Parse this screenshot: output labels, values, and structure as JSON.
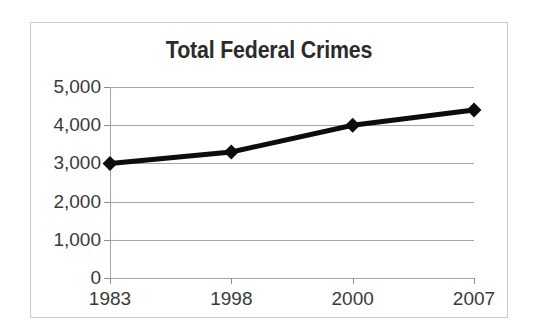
{
  "chart_data": {
    "type": "line",
    "title": "Total Federal Crimes",
    "xlabel": "",
    "ylabel": "",
    "categories": [
      "1983",
      "1998",
      "2000",
      "2007"
    ],
    "values": [
      3000,
      3300,
      4000,
      4400
    ],
    "series": [
      {
        "name": "Total Federal Crimes",
        "values": [
          3000,
          3300,
          4000,
          4400
        ]
      }
    ],
    "ylim": [
      0,
      5000
    ],
    "ytick_values": [
      0,
      1000,
      2000,
      3000,
      4000,
      5000
    ],
    "ytick_labels": [
      "0",
      "1,000",
      "2,000",
      "3,000",
      "4,000",
      "5,000"
    ],
    "grid": true,
    "grid_orientation": "horizontal",
    "legend": false,
    "legend_position": "none",
    "marker": "diamond",
    "line_color": "#0d0d0d",
    "marker_color": "#0d0d0d",
    "grid_color": "#a6a6a6",
    "title_color": "#2b2b2b",
    "tick_label_color": "#3a3a3a",
    "border_color": "#c9c9c9",
    "background_color": "#ffffff",
    "annotations": []
  }
}
